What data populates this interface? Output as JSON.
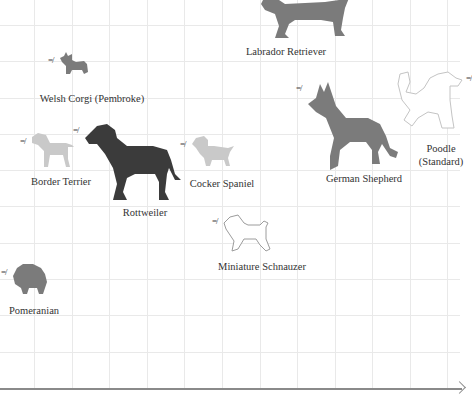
{
  "chart_data": {
    "type": "scatter",
    "title": "",
    "xlabel": "",
    "ylabel": "",
    "grid": true,
    "legend": "none",
    "x_axis": {
      "arrow": true,
      "tick_labels": []
    },
    "colors": {
      "dark": "#3b3b3b",
      "medium": "#7b7b7b",
      "light": "#c9c9c9",
      "outline": "#c4c4c4",
      "outline_dark": "#9c9c9c",
      "grid": "#e9e9e9",
      "axis": "#8a8a8a"
    },
    "points": [
      {
        "name": "Labrador Retriever",
        "label_x": 286,
        "label_y": 45,
        "icon_x": 255,
        "icon_y": -10,
        "shade": "medium",
        "kind": "labrador"
      },
      {
        "name": "Welsh Corgi (Pembroke)",
        "label_x": 92,
        "label_y": 92,
        "icon_x": 58,
        "icon_y": 52,
        "shade": "medium",
        "kind": "corgi"
      },
      {
        "name": "Border Terrier",
        "label_x": 61,
        "label_y": 175,
        "icon_x": 30,
        "icon_y": 133,
        "shade": "light",
        "kind": "terrier"
      },
      {
        "name": "Rottweiler",
        "label_x": 145,
        "label_y": 206,
        "icon_x": 83,
        "icon_y": 122,
        "shade": "dark",
        "kind": "rottweiler"
      },
      {
        "name": "Cocker Spaniel",
        "label_x": 222,
        "label_y": 177,
        "icon_x": 190,
        "icon_y": 136,
        "shade": "light",
        "kind": "spaniel"
      },
      {
        "name": "German Shepherd",
        "label_x": 364,
        "label_y": 172,
        "icon_x": 306,
        "icon_y": 80,
        "shade": "medium",
        "kind": "shepherd"
      },
      {
        "name": "Poodle",
        "name_line2": "(Standard)",
        "label_x": 441,
        "label_y": 142,
        "icon_x": 392,
        "icon_y": 70,
        "shade": "outline",
        "kind": "poodle"
      },
      {
        "name": "Miniature Schnauzer",
        "label_x": 262,
        "label_y": 260,
        "icon_x": 222,
        "icon_y": 213,
        "shade": "outline_dark",
        "kind": "schnauzer"
      },
      {
        "name": "Pomeranian",
        "label_x": 34,
        "label_y": 304,
        "icon_x": 11,
        "icon_y": 264,
        "shade": "medium",
        "kind": "pomeranian"
      }
    ],
    "grid_x": [
      34,
      72,
      109,
      147,
      184,
      222,
      260,
      297,
      335,
      372,
      410,
      447
    ],
    "grid_y": [
      25,
      61,
      98,
      134,
      170,
      206,
      243,
      279,
      315,
      352
    ]
  },
  "sound_mark": "=/"
}
